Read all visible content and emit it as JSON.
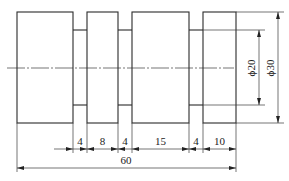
{
  "drawing": {
    "type": "stepped-shaft-engineering-drawing",
    "diameters": {
      "large_label": "ϕ30",
      "small_label": "ϕ20"
    },
    "length_dimensions": [
      {
        "label": "4"
      },
      {
        "label": "8"
      },
      {
        "label": "4"
      },
      {
        "label": "15"
      },
      {
        "label": "4"
      },
      {
        "label": "10"
      }
    ],
    "overall_length": {
      "label": "60"
    },
    "colors": {
      "line": "#2b2b2b",
      "background": "#ffffff"
    }
  }
}
